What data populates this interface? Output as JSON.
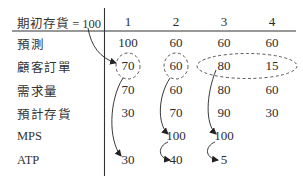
{
  "table": {
    "header_label": "期初存貨 = 100",
    "periods": [
      "1",
      "2",
      "3",
      "4"
    ],
    "rows": [
      {
        "label": "預測",
        "values": [
          "100",
          "60",
          "60",
          "60"
        ]
      },
      {
        "label": "顧客訂單",
        "values": [
          "70",
          "60",
          "80",
          "15"
        ]
      },
      {
        "label": "需求量",
        "values": [
          "70",
          "60",
          "80",
          "60"
        ]
      },
      {
        "label": "預計存貨",
        "values": [
          "30",
          "70",
          "90",
          "30"
        ]
      },
      {
        "label": "MPS",
        "values": [
          "",
          "100",
          "100",
          ""
        ]
      },
      {
        "label": "ATP",
        "values": [
          "30",
          "40",
          "5",
          ""
        ]
      }
    ]
  },
  "highlights": {
    "circled_customer_orders": [
      [
        "1"
      ],
      [
        "2"
      ],
      [
        "3",
        "4"
      ]
    ],
    "arrows": [
      {
        "from": "期初存貨",
        "to": "顧客訂單 period 1"
      },
      {
        "from": "顧客訂單 period 1",
        "to": "ATP period 1"
      },
      {
        "from": "顧客訂單 period 2",
        "to": "MPS period 2"
      },
      {
        "from": "MPS period 2",
        "to": "ATP period 2"
      },
      {
        "from": "顧客訂單 periods 3-4",
        "to": "MPS period 3"
      },
      {
        "from": "MPS period 3",
        "to": "ATP period 3"
      }
    ]
  }
}
